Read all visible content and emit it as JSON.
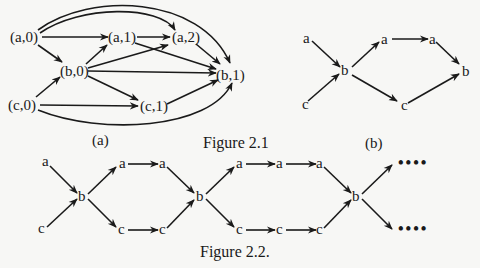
{
  "figure_2_1": {
    "caption": "Figure 2.1",
    "subfig_a": {
      "label": "(a)",
      "nodes": {
        "a0": "(a,0)",
        "b0": "(b,0)",
        "c0": "(c,0)",
        "a1": "(a,1)",
        "a2": "(a,2)",
        "c1": "(c,1)",
        "b1": "(b,1)"
      },
      "edges": [
        [
          "a0",
          "a1"
        ],
        [
          "a0",
          "b0"
        ],
        [
          "a0",
          "a2"
        ],
        [
          "a0",
          "b1"
        ],
        [
          "c0",
          "b0"
        ],
        [
          "c0",
          "c1"
        ],
        [
          "c0",
          "b1"
        ],
        [
          "b0",
          "a1"
        ],
        [
          "b0",
          "a2"
        ],
        [
          "b0",
          "b1"
        ],
        [
          "b0",
          "c1"
        ],
        [
          "a1",
          "a2"
        ],
        [
          "a1",
          "b1"
        ],
        [
          "a2",
          "b1"
        ],
        [
          "c1",
          "b1"
        ]
      ]
    },
    "subfig_b": {
      "label": "(b)",
      "nodes": {
        "a_in": "a",
        "c_in": "c",
        "b_mid": "b",
        "a_1": "a",
        "a_2": "a",
        "c_1": "c",
        "b_out": "b"
      },
      "edges": [
        [
          "a_in",
          "b_mid"
        ],
        [
          "c_in",
          "b_mid"
        ],
        [
          "b_mid",
          "a_1"
        ],
        [
          "b_mid",
          "c_1"
        ],
        [
          "a_1",
          "a_2"
        ],
        [
          "a_2",
          "b_out"
        ],
        [
          "c_1",
          "b_out"
        ]
      ]
    }
  },
  "figure_2_2": {
    "caption": "Figure 2.2.",
    "nodes": {
      "a_in": "a",
      "c_in": "c",
      "b1": "b",
      "a11": "a",
      "a12": "a",
      "c11": "c",
      "c12": "c",
      "b2": "b",
      "a21": "a",
      "a22": "a",
      "a23": "a",
      "c21": "c",
      "c22": "c",
      "c23": "c",
      "b3": "b",
      "ellipsis_top": "••••",
      "ellipsis_bottom": "••••"
    }
  }
}
